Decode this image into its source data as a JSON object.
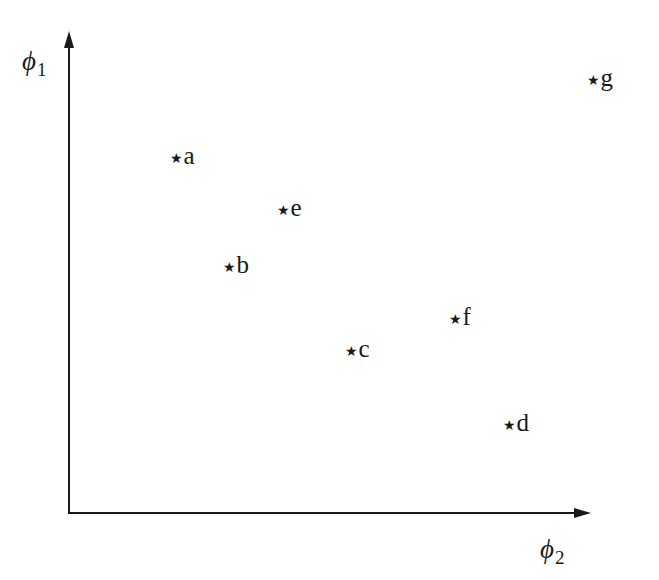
{
  "diagram": {
    "type": "scatter-sketch",
    "axes": {
      "y_axis": {
        "symbol": "ϕ",
        "subscript": "1",
        "label": "ϕ1"
      },
      "x_axis": {
        "symbol": "ϕ",
        "subscript": "2",
        "label": "ϕ2"
      }
    },
    "marker_glyph": "★",
    "points": [
      {
        "label": "a",
        "x": 177,
        "y": 157
      },
      {
        "label": "e",
        "x": 284,
        "y": 209
      },
      {
        "label": "b",
        "x": 230,
        "y": 266
      },
      {
        "label": "c",
        "x": 352,
        "y": 350
      },
      {
        "label": "f",
        "x": 456,
        "y": 318
      },
      {
        "label": "d",
        "x": 510,
        "y": 424
      },
      {
        "label": "g",
        "x": 594,
        "y": 79
      }
    ],
    "colors": {
      "ink": "#1a1a1a",
      "background": "#ffffff"
    }
  }
}
